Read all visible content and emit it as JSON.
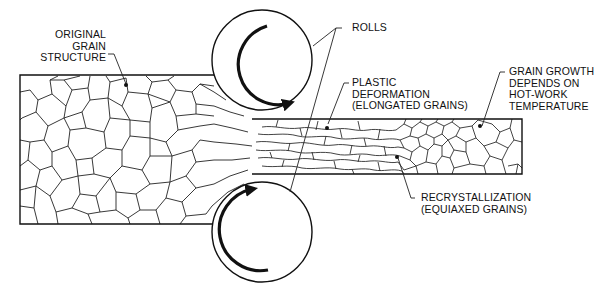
{
  "diagram": {
    "colors": {
      "line": "#1a1a1a",
      "background": "#ffffff"
    },
    "labels": {
      "original_grain": [
        "ORIGINAL",
        "GRAIN",
        "STRUCTURE"
      ],
      "rolls": [
        "ROLLS"
      ],
      "plastic_deformation": [
        "PLASTIC",
        "DEFORMATION",
        "(ELONGATED GRAINS)"
      ],
      "grain_growth": [
        "GRAIN GROWTH",
        "DEPENDS ON",
        "HOT-WORK",
        "TEMPERATURE"
      ],
      "recrystallization": [
        "RECRYSTALLIZATION",
        "(EQUIAXED GRAINS)"
      ]
    },
    "components": {
      "top_roll": {
        "rotation": "clockwise",
        "icon": "rotation-arrow"
      },
      "bottom_roll": {
        "rotation": "counterclockwise",
        "icon": "rotation-arrow"
      },
      "workpiece_in": "thick slab, equiaxed grains",
      "workpiece_out": "thin strip, elongated then recrystallized grains"
    }
  }
}
